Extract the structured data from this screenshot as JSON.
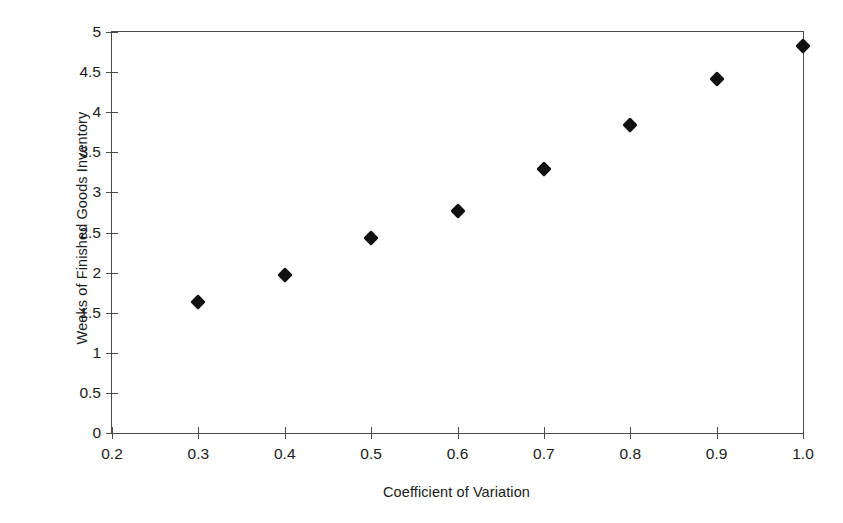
{
  "chart_data": {
    "type": "scatter",
    "title": "",
    "xlabel": "Coefficient of Variation",
    "ylabel": "Weeks of Finished Goods Inventory",
    "xlim": [
      0.2,
      1.0
    ],
    "ylim": [
      0,
      5
    ],
    "grid": false,
    "legend": null,
    "marker": "diamond",
    "marker_color": "#111111",
    "x": [
      0.3,
      0.4,
      0.5,
      0.6,
      0.7,
      0.8,
      0.9,
      1.0
    ],
    "y": [
      1.63,
      1.97,
      2.43,
      2.77,
      3.29,
      3.84,
      4.42,
      4.83
    ],
    "xticks": [
      "0.2",
      "0.3",
      "0.4",
      "0.5",
      "0.6",
      "0.7",
      "0.8",
      "0.9",
      "1.0"
    ],
    "xtick_values": [
      0.2,
      0.3,
      0.4,
      0.5,
      0.6,
      0.7,
      0.8,
      0.9,
      1.0
    ],
    "yticks": [
      "0",
      "0.5",
      "1",
      "1.5",
      "2",
      "2.5",
      "3",
      "3.5",
      "4",
      "4.5",
      "5"
    ],
    "ytick_values": [
      0,
      0.5,
      1,
      1.5,
      2,
      2.5,
      3,
      3.5,
      4,
      4.5,
      5
    ],
    "axis_color": "#4a4a4a",
    "background": "#ffffff"
  }
}
